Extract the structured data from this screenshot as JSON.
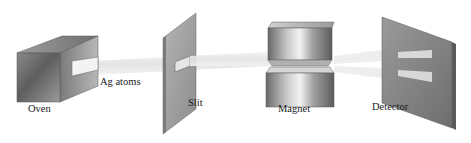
{
  "diagram": {
    "components": [
      {
        "id": "oven",
        "label": "Oven"
      },
      {
        "id": "beam",
        "label": "Ag atoms"
      },
      {
        "id": "slit",
        "label": "Slit"
      },
      {
        "id": "magnet",
        "label": "Magnet"
      },
      {
        "id": "detector",
        "label": "Detector"
      }
    ],
    "colors": {
      "metal_dark": "#6e6e6e",
      "metal_mid": "#a8a8a8",
      "metal_light": "#e8e8e8",
      "beam": "#ececec",
      "detector_face": "#8a8a8a",
      "detector_edge": "#5a5a5a",
      "text": "#1a1a1a"
    }
  }
}
